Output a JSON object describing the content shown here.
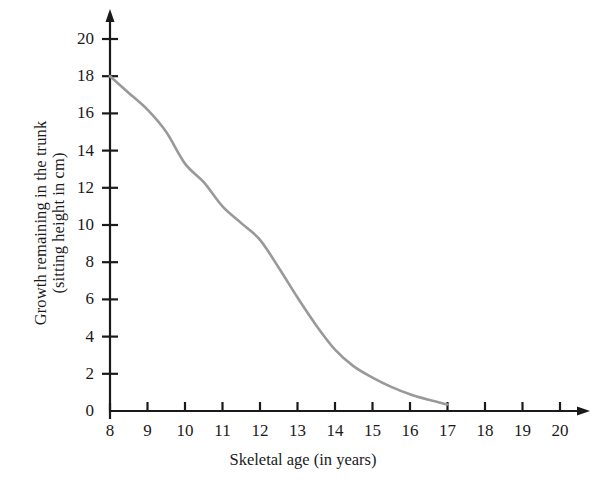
{
  "chart_data": {
    "type": "line",
    "title": "",
    "xlabel": "Skeletal age (in years)",
    "ylabel_line1": "Growth remaining in the trunk",
    "ylabel_line2": "(sitting height in cm)",
    "xlim": [
      8,
      20
    ],
    "ylim": [
      0,
      20
    ],
    "xticks": [
      8,
      9,
      10,
      11,
      12,
      13,
      14,
      15,
      16,
      17,
      18,
      19,
      20
    ],
    "yticks": [
      0,
      2,
      4,
      6,
      8,
      10,
      12,
      14,
      16,
      18,
      20
    ],
    "xtick_labels": [
      "8",
      "9",
      "10",
      "11",
      "12",
      "13",
      "14",
      "15",
      "16",
      "17",
      "18",
      "19",
      "20"
    ],
    "ytick_labels": [
      "0",
      "2",
      "4",
      "6",
      "8",
      "10",
      "12",
      "14",
      "16",
      "18",
      "20"
    ],
    "grid": false,
    "legend": false,
    "series": [
      {
        "name": "Growth remaining in the trunk",
        "color": "#999999",
        "line_width": 2.6,
        "x": [
          8,
          8.5,
          9,
          9.5,
          10,
          10.5,
          11,
          11.5,
          12,
          12.5,
          13,
          13.5,
          14,
          14.5,
          15,
          15.5,
          16,
          16.5,
          17
        ],
        "y": [
          18.0,
          17.1,
          16.2,
          15.0,
          13.3,
          12.3,
          11.0,
          10.1,
          9.2,
          7.7,
          6.1,
          4.6,
          3.3,
          2.4,
          1.8,
          1.3,
          0.9,
          0.6,
          0.35
        ]
      }
    ],
    "axis_color": "#1a1a1a",
    "background_color": "#ffffff",
    "x_axis_arrow": true,
    "y_axis_arrow": true
  }
}
